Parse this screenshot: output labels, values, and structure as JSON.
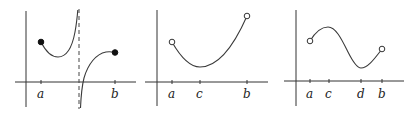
{
  "figure": {
    "panels": [
      {
        "id": "panel-1",
        "description": "Function on [a,b] with vertical asymptote; closed endpoints",
        "tick_labels": [
          "a",
          "b"
        ],
        "endpoints": {
          "a": "closed",
          "b": "closed"
        },
        "features": [
          "vertical-asymptote"
        ]
      },
      {
        "id": "panel-2",
        "description": "U-shaped function on open interval (a,b) with minimum at c",
        "tick_labels": [
          "a",
          "c",
          "b"
        ],
        "endpoints": {
          "a": "open",
          "b": "open"
        },
        "features": [
          "minimum-at-c"
        ]
      },
      {
        "id": "panel-3",
        "description": "Function on open interval (a,b) with local max at c and local min at d",
        "tick_labels": [
          "a",
          "c",
          "d",
          "b"
        ],
        "endpoints": {
          "a": "open",
          "b": "open"
        },
        "features": [
          "maximum-at-c",
          "minimum-at-d"
        ]
      }
    ]
  },
  "labels": {
    "p1": {
      "a": "a",
      "b": "b"
    },
    "p2": {
      "a": "a",
      "c": "c",
      "b": "b"
    },
    "p3": {
      "a": "a",
      "c": "c",
      "d": "d",
      "b": "b"
    }
  }
}
